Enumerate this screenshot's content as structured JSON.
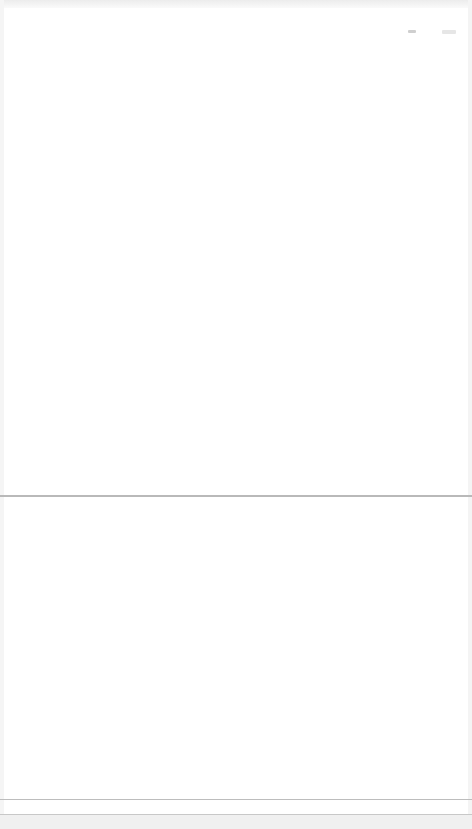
{
  "window": {
    "background": "#ffffff",
    "divider_color": "#b9b9b9"
  },
  "header": {
    "status_indicator": "status-indicator"
  },
  "panels": [
    {
      "name": "top-panel",
      "content": ""
    },
    {
      "name": "bottom-panel",
      "content": ""
    }
  ],
  "footer": {
    "content": ""
  }
}
